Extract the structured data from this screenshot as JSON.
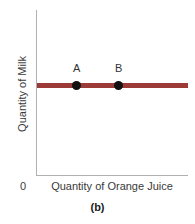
{
  "chart_data": {
    "type": "line",
    "title": "",
    "subtitle": "",
    "caption": "(b)",
    "xlabel": "Quantity of Orange Juice",
    "ylabel": "Quantity of Milk",
    "origin_label": "0",
    "grid": false,
    "legend": "none",
    "xlim": [
      0,
      100
    ],
    "ylim": [
      0,
      100
    ],
    "axis_ticks": {
      "x": [],
      "y": []
    },
    "series": [
      {
        "name": "budget-line",
        "kind": "horizontal-line",
        "color": "#9b3a37",
        "y_value": 55,
        "x_start": 0,
        "x_end": 100,
        "thickness_px": 5
      }
    ],
    "points": [
      {
        "label": "A",
        "x": 24,
        "y": 55,
        "color": "#111111"
      },
      {
        "label": "B",
        "x": 52,
        "y": 55,
        "color": "#111111"
      }
    ],
    "annotations": [
      {
        "text": "A",
        "position": "above-point-A"
      },
      {
        "text": "B",
        "position": "above-point-B"
      }
    ],
    "colors": {
      "line": "#9b3a37",
      "point": "#111111",
      "axis": "#b0b0b0",
      "text": "#3a3a3a",
      "background": "#ffffff"
    }
  }
}
